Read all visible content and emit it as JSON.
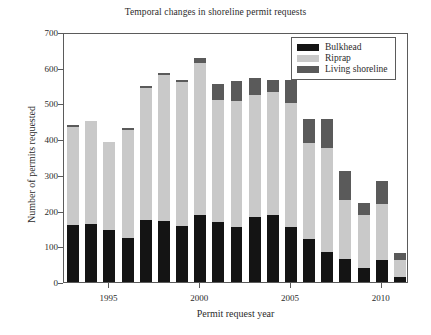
{
  "chart_data": {
    "type": "bar",
    "stacked": true,
    "title": "Temporal changes in shoreline permit requests",
    "xlabel": "Permit request year",
    "ylabel": "Number of permits requested",
    "ylim": [
      0,
      700
    ],
    "ytick_labels": [
      "0",
      "100",
      "200",
      "300",
      "400",
      "500",
      "600",
      "700"
    ],
    "ytick_values": [
      0,
      100,
      200,
      300,
      400,
      500,
      600,
      700
    ],
    "xtick_labels": [
      "1995",
      "2000",
      "2005",
      "2010"
    ],
    "xtick_values": [
      1995,
      2000,
      2005,
      2010
    ],
    "grid": false,
    "legend_position": "top-right",
    "categories": [
      1993,
      1994,
      1995,
      1996,
      1997,
      1998,
      1999,
      2000,
      2001,
      2002,
      2003,
      2004,
      2005,
      2006,
      2007,
      2008,
      2009,
      2010,
      2011
    ],
    "series": [
      {
        "name": "Bulkhead",
        "color": "#141414",
        "values": [
          159,
          162,
          147,
          124,
          174,
          172,
          157,
          187,
          169,
          154,
          182,
          187,
          154,
          120,
          84,
          64,
          39,
          62,
          13
        ]
      },
      {
        "name": "Riprap",
        "color": "#c9c9c9",
        "values": [
          275,
          289,
          245,
          303,
          369,
          409,
          404,
          427,
          341,
          353,
          342,
          344,
          346,
          268,
          290,
          166,
          150,
          157,
          50
        ]
      },
      {
        "name": "Living shoreline",
        "color": "#5a5a5a",
        "values": [
          5,
          0,
          0,
          3,
          5,
          5,
          5,
          13,
          44,
          56,
          48,
          35,
          67,
          68,
          83,
          81,
          32,
          64,
          18
        ]
      }
    ],
    "totals": [
      439,
      451,
      392,
      430,
      548,
      586,
      566,
      627,
      554,
      563,
      572,
      566,
      567,
      456,
      457,
      311,
      221,
      283,
      81
    ]
  },
  "legend": {
    "entries": [
      {
        "label": "Bulkhead",
        "swatch": "legend-swatch-bulkhead"
      },
      {
        "label": "Riprap",
        "swatch": "legend-swatch-riprap"
      },
      {
        "label": "Living shoreline",
        "swatch": "legend-swatch-living-shoreline"
      }
    ]
  }
}
